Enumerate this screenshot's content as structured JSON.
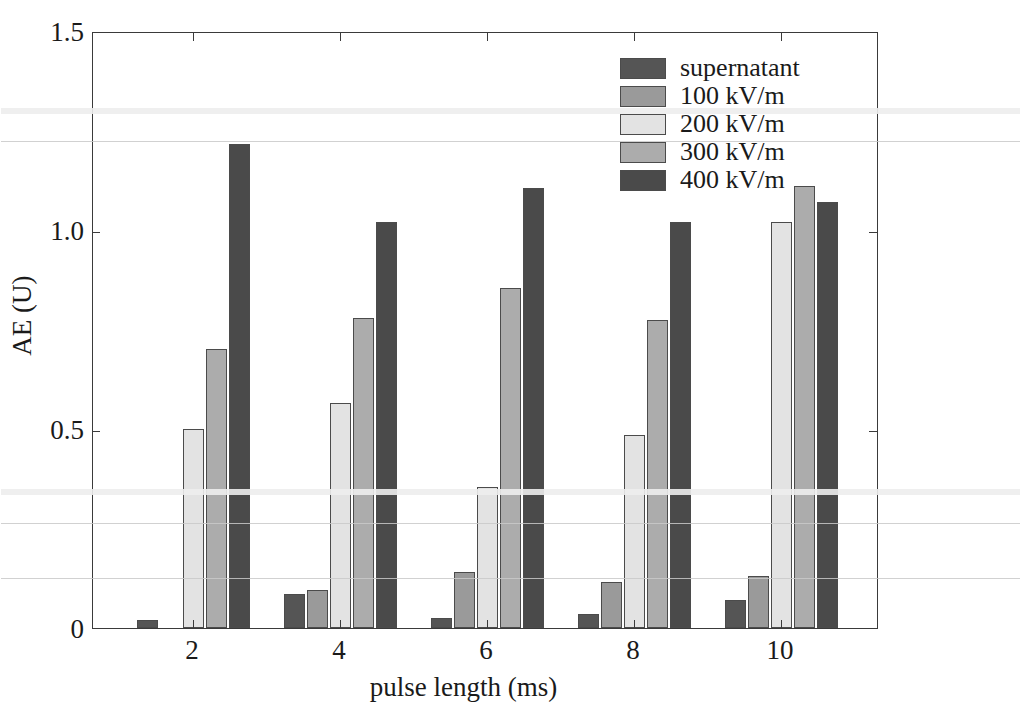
{
  "chart_data": {
    "type": "bar",
    "title": "",
    "xlabel": "pulse length (ms)",
    "ylabel": "AE (U)",
    "categories": [
      "2",
      "4",
      "6",
      "8",
      "10"
    ],
    "xtick_labels": [
      "2",
      "4",
      "6",
      "8",
      "10"
    ],
    "ytick_labels": [
      "0",
      "0.5",
      "1.0",
      "1.5"
    ],
    "ytick_values": [
      0,
      0.5,
      1.0,
      1.5
    ],
    "ylim": [
      0,
      1.5
    ],
    "grid": false,
    "legend_position": "upper right",
    "series": [
      {
        "name": "supernatant",
        "color": "#555555",
        "values": [
          0.02,
          0.085,
          0.025,
          0.035,
          0.07
        ]
      },
      {
        "name": "100 kV/m",
        "color": "#9a9a9a",
        "values": [
          0.0,
          0.095,
          0.14,
          0.115,
          0.13
        ]
      },
      {
        "name": "200 kV/m",
        "color": "#e3e3e3",
        "values": [
          0.5,
          0.565,
          0.355,
          0.485,
          1.02
        ]
      },
      {
        "name": "300 kV/m",
        "color": "#acacac",
        "values": [
          0.7,
          0.78,
          0.855,
          0.775,
          1.11
        ]
      },
      {
        "name": "400 kV/m",
        "color": "#4a4a4a",
        "values": [
          1.215,
          1.02,
          1.105,
          1.02,
          1.07
        ]
      }
    ]
  },
  "legend": {
    "entries": [
      {
        "label": "supernatant",
        "color": "#555555"
      },
      {
        "label": "100 kV/m",
        "color": "#9a9a9a"
      },
      {
        "label": "200 kV/m",
        "color": "#e3e3e3"
      },
      {
        "label": "300 kV/m",
        "color": "#acacac"
      },
      {
        "label": "400 kV/m",
        "color": "#4a4a4a"
      }
    ]
  },
  "axes": {
    "x_title": "pulse length (ms)",
    "y_title": "AE (U)"
  },
  "colors": {
    "frame": "#3a3a3a",
    "text": "#1a1a1a",
    "background": "#ffffff"
  }
}
